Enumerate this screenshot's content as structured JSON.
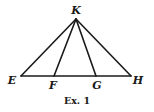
{
  "figure": {
    "caption": "Ex. 1",
    "points": [
      {
        "id": "K",
        "label": "K",
        "x": 76,
        "y": 19,
        "lx": 76,
        "ly": 14
      },
      {
        "id": "E",
        "label": "E",
        "x": 21,
        "y": 76,
        "lx": 12,
        "ly": 84
      },
      {
        "id": "F",
        "label": "F",
        "x": 54,
        "y": 76,
        "lx": 53,
        "ly": 89
      },
      {
        "id": "G",
        "label": "G",
        "x": 96,
        "y": 76,
        "lx": 97,
        "ly": 89
      },
      {
        "id": "H",
        "label": "H",
        "x": 131,
        "y": 76,
        "lx": 138,
        "ly": 84
      }
    ],
    "segments": [
      {
        "from": "K",
        "to": "E"
      },
      {
        "from": "K",
        "to": "F"
      },
      {
        "from": "K",
        "to": "G"
      },
      {
        "from": "K",
        "to": "H"
      },
      {
        "from": "E",
        "to": "H"
      }
    ],
    "stroke_color": "#1a1a1a",
    "background": "#ffffff"
  }
}
